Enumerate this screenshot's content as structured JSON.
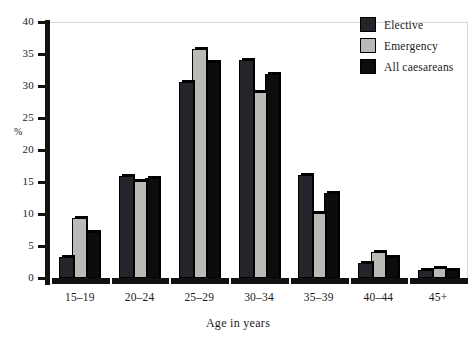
{
  "chart_data": {
    "type": "bar",
    "title": "",
    "subtitle": "",
    "xlabel": "Age in years",
    "ylabel": "%",
    "categories": [
      "15–19",
      "20–24",
      "25–29",
      "30–34",
      "35–39",
      "40–44",
      "45+"
    ],
    "series": [
      {
        "name": "Elective",
        "color": "#26242a",
        "values": [
          3.0,
          15.7,
          30.3,
          33.8,
          15.8,
          2.1,
          1.0
        ]
      },
      {
        "name": "Emergency",
        "color": "#b9b9b6",
        "values": [
          9.0,
          14.8,
          35.5,
          28.7,
          9.8,
          3.7,
          1.2
        ]
      },
      {
        "name": "All caesareans",
        "color": "#0c0c0c",
        "values": [
          6.8,
          15.3,
          33.5,
          31.5,
          13.0,
          2.9,
          1.0
        ]
      }
    ],
    "ylim": [
      0,
      40
    ],
    "yticks": [
      0,
      5,
      10,
      15,
      20,
      25,
      30,
      35,
      40
    ],
    "ytick_labels": [
      "0",
      "5",
      "10",
      "15",
      "20",
      "25",
      "30",
      "35",
      "40"
    ],
    "grid": false,
    "legend_position": "top-right",
    "legend_entries": [
      "Elective",
      "Emergency",
      "All caesareans"
    ]
  }
}
